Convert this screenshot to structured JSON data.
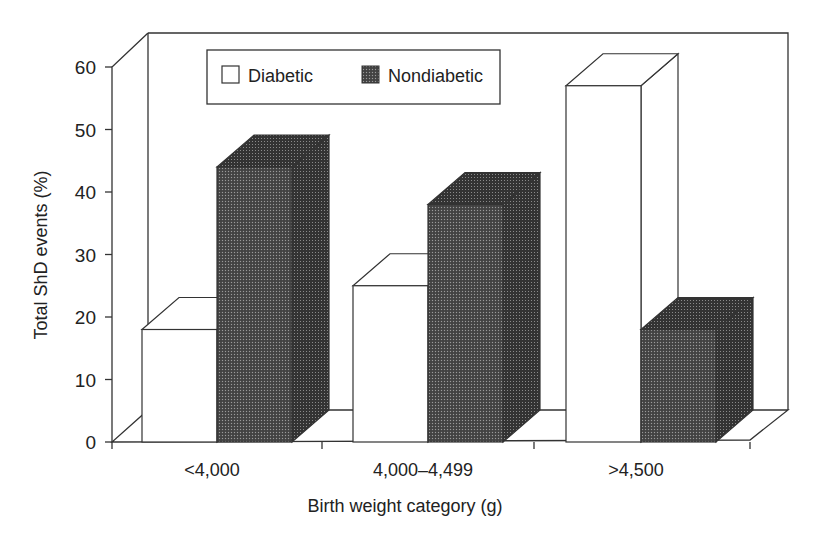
{
  "chart_data": {
    "type": "bar",
    "style": "3d-clustered",
    "title": "",
    "xlabel": "Birth weight category (g)",
    "ylabel": "Total ShD events (%)",
    "ylim": [
      0,
      60
    ],
    "yticks": [
      "0",
      "10",
      "20",
      "30",
      "40",
      "50",
      "60"
    ],
    "categories": [
      "<4,000",
      "4,000–4,499",
      ">4,500"
    ],
    "series": [
      {
        "name": "Diabetic",
        "fill": "#ffffff",
        "values": [
          18,
          25,
          57
        ]
      },
      {
        "name": "Nondiabetic",
        "fill": "#3a3a3a",
        "values": [
          44,
          38,
          18
        ]
      }
    ],
    "legend": {
      "position": "top-inside",
      "entries": [
        "Diabetic",
        "Nondiabetic"
      ]
    },
    "grid": false
  }
}
